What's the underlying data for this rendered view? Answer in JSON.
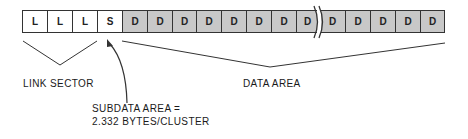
{
  "diagram": {
    "cells": [
      {
        "label": "L",
        "type": "link",
        "fill": "#ffffff"
      },
      {
        "label": "L",
        "type": "link",
        "fill": "#ffffff"
      },
      {
        "label": "L",
        "type": "link",
        "fill": "#ffffff"
      },
      {
        "label": "S",
        "type": "subdata",
        "fill": "#ffffff"
      },
      {
        "label": "D",
        "type": "data",
        "fill": "#c8c8c8"
      },
      {
        "label": "D",
        "type": "data",
        "fill": "#c8c8c8"
      },
      {
        "label": "D",
        "type": "data",
        "fill": "#c8c8c8"
      },
      {
        "label": "D",
        "type": "data",
        "fill": "#c8c8c8"
      },
      {
        "label": "D",
        "type": "data",
        "fill": "#c8c8c8"
      },
      {
        "label": "D",
        "type": "data",
        "fill": "#c8c8c8"
      },
      {
        "label": "D",
        "type": "data",
        "fill": "#c8c8c8"
      },
      {
        "label": "D",
        "type": "data",
        "fill": "#c8c8c8"
      },
      {
        "label": "D",
        "type": "data",
        "fill": "#c8c8c8"
      },
      {
        "label": "D",
        "type": "data",
        "fill": "#c8c8c8"
      },
      {
        "label": "D",
        "type": "data",
        "fill": "#c8c8c8"
      },
      {
        "label": "D",
        "type": "data",
        "fill": "#c8c8c8"
      },
      {
        "label": "D",
        "type": "data",
        "fill": "#c8c8c8"
      }
    ],
    "break_after_cell_index": 11,
    "labels": {
      "link_sector": "LINK SECTOR",
      "data_area": "DATA AREA",
      "subdata_line1": "SUBDATA AREA =",
      "subdata_line2": "2.332 BYTES/CLUSTER"
    },
    "colors": {
      "line": "#333333",
      "data_fill": "#c8c8c8",
      "link_fill": "#ffffff"
    }
  }
}
